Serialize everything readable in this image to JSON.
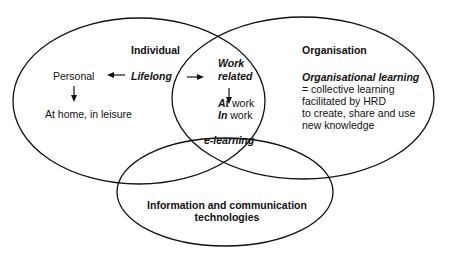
{
  "diagram": {
    "type": "venn",
    "sets": [
      {
        "id": "individual",
        "label": "Individual"
      },
      {
        "id": "organisation",
        "label": "Organisation"
      },
      {
        "id": "ict",
        "label": "Information and communication technologies"
      }
    ],
    "individual": {
      "title": "Individual",
      "lifelong": "Lifelong",
      "personal": "Personal",
      "at_home": "At home, in leisure"
    },
    "overlap_individual_organisation": {
      "work_line1": "Work",
      "work_line2": "related",
      "at_prefix": "At",
      "at_suffix": " work",
      "in_prefix": "In",
      "in_suffix": " work"
    },
    "center": {
      "label": "e-learning"
    },
    "organisation": {
      "title": "Organisation",
      "subtitle": "Organisational learning",
      "lines": [
        "= collective learning",
        "facilitated by HRD",
        "to create, share and use",
        "new knowledge"
      ]
    },
    "ict": {
      "line1": "Information and communication",
      "line2": "technologies"
    },
    "colors": {
      "stroke": "#111111",
      "background": "#ffffff"
    }
  }
}
